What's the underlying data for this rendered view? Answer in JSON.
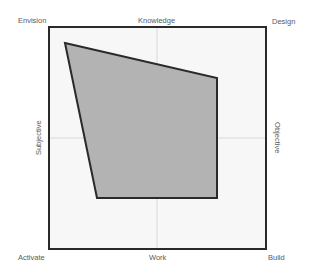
{
  "diagram": {
    "corners": {
      "top_left": "Envision",
      "top_right": "Design",
      "bottom_left": "Activate",
      "bottom_right": "Build"
    },
    "axes": {
      "top": "Knowledge",
      "bottom": "Work",
      "left": "Subjective",
      "right": "Objective"
    },
    "frame": {
      "x": 49,
      "y": 27,
      "width": 217,
      "height": 222
    },
    "gridlines": {
      "vertical_x": 157,
      "horizontal_y": 138
    },
    "polygon": {
      "points": [
        [
          65,
          43
        ],
        [
          217,
          78
        ],
        [
          217,
          198
        ],
        [
          97,
          198
        ]
      ],
      "fill": "#b3b3b3",
      "stroke": "#2a2a2a"
    },
    "colors": {
      "frame_stroke": "#2a2a2a",
      "frame_fill": "#f7f7f7",
      "gridline": "#d0d0d0",
      "label_text": "#5a5a5a"
    }
  }
}
